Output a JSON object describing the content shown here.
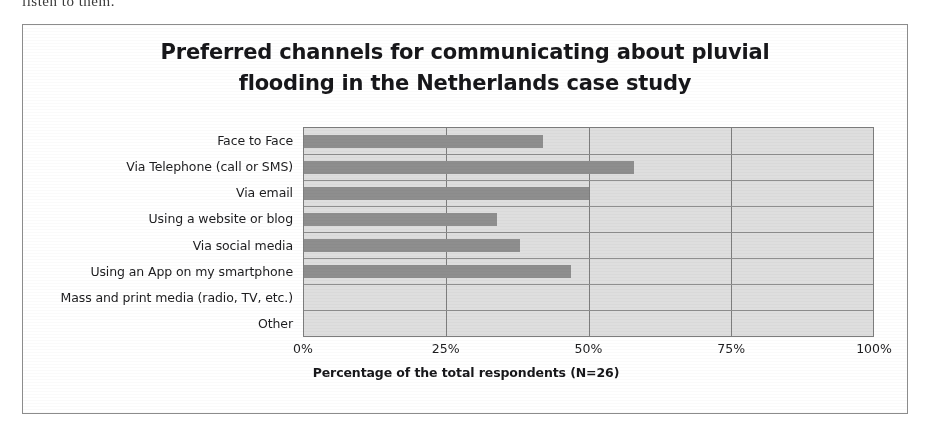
{
  "page_tail_text": "listen to them.",
  "chart_data": {
    "type": "bar",
    "orientation": "horizontal",
    "title": "Preferred channels for communicating about pluvial flooding in the Netherlands case study",
    "title_line1": "Preferred channels for communicating about pluvial",
    "title_line2": "flooding in the Netherlands case study",
    "xlabel": "Percentage of the total respondents (N=26)",
    "ylabel": "",
    "categories": [
      "Face to Face",
      "Via Telephone (call or SMS)",
      "Via email",
      "Using a website or blog",
      "Via social media",
      "Using an App on my smartphone",
      "Mass and print media (radio, TV, etc.)",
      "Other"
    ],
    "values": [
      42,
      58,
      50,
      34,
      38,
      47,
      0,
      0
    ],
    "xlim": [
      0,
      100
    ],
    "xticks": [
      0,
      25,
      50,
      75,
      100
    ],
    "xtick_labels": [
      "0%",
      "25%",
      "50%",
      "75%",
      "100%"
    ],
    "grid": true,
    "grid_axis": "both",
    "legend": false,
    "units": "%",
    "bar_color": "#8e8e8e",
    "plot_background": "#dedede",
    "grid_color": "#7d7d7d",
    "frame_color": "#8c8c8c",
    "text_color": "#1d1d1f"
  }
}
